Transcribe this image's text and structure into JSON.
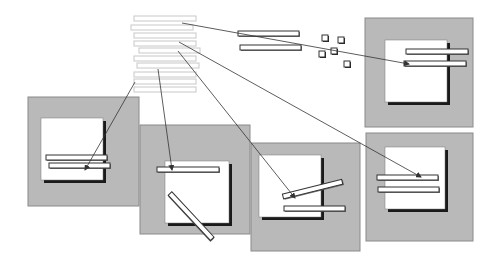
{
  "diagram": {
    "colors": {
      "background": "#ffffff",
      "panel_fill": "#b9b9b9",
      "panel_stroke": "#8a8a8a",
      "square_fill": "#ffffff",
      "square_shadow": "#1a1a1a",
      "strip_fill": "#ffffff",
      "strip_stroke": "#333333",
      "stack_strip_stroke": "#c8c8c8",
      "arrow_color": "#333333"
    },
    "stack": {
      "strips": [
        {
          "x": 134,
          "y": 16,
          "w": 62,
          "h": 5
        },
        {
          "x": 131,
          "y": 25,
          "w": 62,
          "h": 5
        },
        {
          "x": 134,
          "y": 33,
          "w": 62,
          "h": 5
        },
        {
          "x": 134,
          "y": 41,
          "w": 62,
          "h": 5
        },
        {
          "x": 139,
          "y": 48,
          "w": 61,
          "h": 5
        },
        {
          "x": 134,
          "y": 56,
          "w": 62,
          "h": 5
        },
        {
          "x": 137,
          "y": 63,
          "w": 62,
          "h": 5
        },
        {
          "x": 134,
          "y": 72,
          "w": 62,
          "h": 5
        },
        {
          "x": 134,
          "y": 79,
          "w": 62,
          "h": 5
        },
        {
          "x": 134,
          "y": 87,
          "w": 62,
          "h": 5
        }
      ]
    },
    "loose_strips": [
      {
        "x": 238,
        "y": 31,
        "w": 61,
        "h": 5
      },
      {
        "x": 240,
        "y": 45,
        "w": 61,
        "h": 5
      }
    ],
    "small_squares": [
      {
        "x": 322,
        "y": 35,
        "s": 6
      },
      {
        "x": 338,
        "y": 37,
        "s": 6
      },
      {
        "x": 319,
        "y": 51,
        "s": 6
      },
      {
        "x": 331,
        "y": 48,
        "s": 6
      },
      {
        "x": 344,
        "y": 61,
        "s": 6
      }
    ],
    "panels": [
      {
        "name": "panel-top-right",
        "x": 365,
        "y": 18,
        "w": 108,
        "h": 109,
        "square": {
          "x": 385,
          "y": 40,
          "w": 62,
          "h": 62
        },
        "strips": [
          {
            "x": 406,
            "y": 49,
            "w": 62,
            "h": 5,
            "angle": 0
          },
          {
            "x": 404,
            "y": 61,
            "w": 62,
            "h": 5,
            "angle": 0
          }
        ]
      },
      {
        "name": "panel-left",
        "x": 28,
        "y": 97,
        "w": 111,
        "h": 109,
        "square": {
          "x": 41,
          "y": 118,
          "w": 62,
          "h": 62
        },
        "strips": [
          {
            "x": 46,
            "y": 155,
            "w": 61,
            "h": 5,
            "angle": 0
          },
          {
            "x": 49,
            "y": 163,
            "w": 61,
            "h": 5,
            "angle": 0
          }
        ]
      },
      {
        "name": "panel-middle-1",
        "x": 140,
        "y": 125,
        "w": 110,
        "h": 109,
        "square": {
          "x": 165,
          "y": 161,
          "w": 64,
          "h": 62
        },
        "strips": [
          {
            "x": 157,
            "y": 167,
            "w": 62,
            "h": 5,
            "angle": 0
          },
          {
            "x": 170,
            "y": 191,
            "w": 62,
            "h": 5,
            "angle": 47
          }
        ]
      },
      {
        "name": "panel-middle-2",
        "x": 251,
        "y": 143,
        "w": 109,
        "h": 108,
        "square": {
          "x": 259,
          "y": 155,
          "w": 62,
          "h": 62
        },
        "strips": [
          {
            "x": 283,
            "y": 194,
            "w": 61,
            "h": 5,
            "angle": -14
          },
          {
            "x": 284,
            "y": 206,
            "w": 61,
            "h": 5,
            "angle": 0
          }
        ]
      },
      {
        "name": "panel-bottom-right",
        "x": 366,
        "y": 133,
        "w": 107,
        "h": 108,
        "square": {
          "x": 385,
          "y": 147,
          "w": 60,
          "h": 62
        },
        "strips": [
          {
            "x": 377,
            "y": 175,
            "w": 61,
            "h": 5,
            "angle": 0
          },
          {
            "x": 378,
            "y": 187,
            "w": 61,
            "h": 5,
            "angle": 0
          }
        ]
      }
    ],
    "arrows": [
      {
        "from": [
          182,
          23
        ],
        "to": [
          409,
          64
        ]
      },
      {
        "from": [
          179,
          42
        ],
        "to": [
          421,
          177
        ]
      },
      {
        "from": [
          178,
          51
        ],
        "to": [
          295,
          198
        ]
      },
      {
        "from": [
          158,
          69
        ],
        "to": [
          172,
          170
        ]
      },
      {
        "from": [
          135,
          82
        ],
        "to": [
          85,
          170
        ]
      }
    ]
  }
}
